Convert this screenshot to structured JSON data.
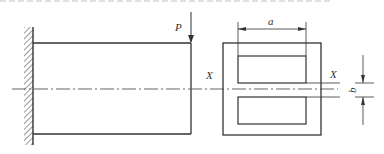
{
  "figure": {
    "type": "engineering-drawing",
    "colors": {
      "line": "#333333",
      "hatch": "#555555",
      "background": "#ffffff"
    }
  },
  "labels": {
    "load": "P",
    "width_dim": "a",
    "gap_dim": "b",
    "axis_left": "X",
    "axis_right": "X"
  },
  "elevation": {
    "wall": {
      "x": 24,
      "y1": 27,
      "y2": 145,
      "line_x": 33
    },
    "beam": {
      "x1": 33,
      "x2": 191,
      "y_top": 43,
      "y_bottom": 134
    },
    "load_arrow": {
      "x": 191,
      "y1": 13,
      "y2": 43
    },
    "centerline_y": 89
  },
  "section": {
    "outer": {
      "x1": 223,
      "x2": 321,
      "y1": 43,
      "y2": 135
    },
    "inner_top": {
      "x1": 238,
      "x2": 306,
      "y1": 56,
      "y2": 83
    },
    "inner_bottom": {
      "x1": 238,
      "x2": 306,
      "y1": 97,
      "y2": 124
    },
    "dim_a": {
      "y": 29,
      "x1": 238,
      "x2": 306
    },
    "dim_b": {
      "x": 363,
      "y1": 83,
      "y2": 97
    }
  }
}
